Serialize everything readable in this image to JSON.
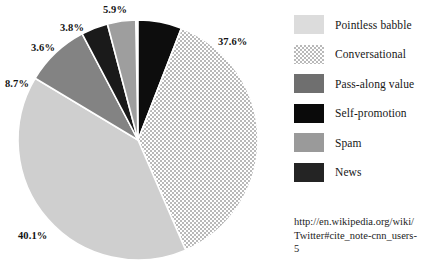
{
  "chart_data": {
    "type": "pie",
    "title": "",
    "xlabel": "",
    "ylabel": "",
    "legend_position": "right",
    "grid": false,
    "categories": [
      "Pointless babble",
      "Conversational",
      "Pass-along value",
      "Self-promotion",
      "Spam",
      "News"
    ],
    "values": [
      40.1,
      37.6,
      8.7,
      3.6,
      3.8,
      5.9
    ],
    "units": "%",
    "data_labels": [
      "40.1%",
      "37.6%",
      "8.7%",
      "3.6%",
      "3.8%",
      "5.9%"
    ],
    "slices": [
      {
        "label": "News",
        "value": 5.9,
        "data_label": "5.9%",
        "fill": "#0d0d0d",
        "pattern": "solid",
        "start_deg": 0.0,
        "end_deg": 21.24,
        "label_x": 103,
        "label_y": 4
      },
      {
        "label": "Conversational",
        "value": 37.6,
        "data_label": "37.6%",
        "fill": "#d6d6d6",
        "pattern": "checker",
        "start_deg": 21.24,
        "end_deg": 156.6,
        "label_x": 218,
        "label_y": 36
      },
      {
        "label": "Pointless babble",
        "value": 40.1,
        "data_label": "40.1%",
        "fill": "#cfcfcf",
        "pattern": "solid",
        "start_deg": 156.6,
        "end_deg": 300.96,
        "label_x": 18,
        "label_y": 230
      },
      {
        "label": "Pass-along value",
        "value": 8.7,
        "data_label": "8.7%",
        "fill": "#838383",
        "pattern": "solid",
        "start_deg": 300.96,
        "end_deg": 332.28,
        "label_x": 5,
        "label_y": 78
      },
      {
        "label": "Self-promotion",
        "value": 3.6,
        "data_label": "3.6%",
        "fill": "#1a1a1a",
        "pattern": "solid",
        "start_deg": 332.28,
        "end_deg": 345.24,
        "label_x": 31,
        "label_y": 42
      },
      {
        "label": "Spam",
        "value": 3.8,
        "data_label": "3.8%",
        "fill": "#9e9e9e",
        "pattern": "solid",
        "start_deg": 345.24,
        "end_deg": 358.92,
        "label_x": 60,
        "label_y": 22
      }
    ]
  },
  "legend": {
    "items": [
      {
        "label": "Pointless babble",
        "swatch_color": "#dcdcdc",
        "pattern": "solid"
      },
      {
        "label": "Conversational",
        "swatch_color": "#d8d8d8",
        "pattern": "checker"
      },
      {
        "label": "Pass-along value",
        "swatch_color": "#6f6f6f",
        "pattern": "solid"
      },
      {
        "label": "Self-promotion",
        "swatch_color": "#0a0a0a",
        "pattern": "solid"
      },
      {
        "label": "Spam",
        "swatch_color": "#9a9a9a",
        "pattern": "solid"
      },
      {
        "label": "News",
        "swatch_color": "#242424",
        "pattern": "solid"
      }
    ]
  },
  "source": {
    "url_text": "http://en.wikipedia.org/wiki/Twitter#cite_note-cnn_users-5"
  },
  "colors": {
    "background": "#ffffff",
    "text": "#131313",
    "slice_separator": "#ffffff"
  }
}
